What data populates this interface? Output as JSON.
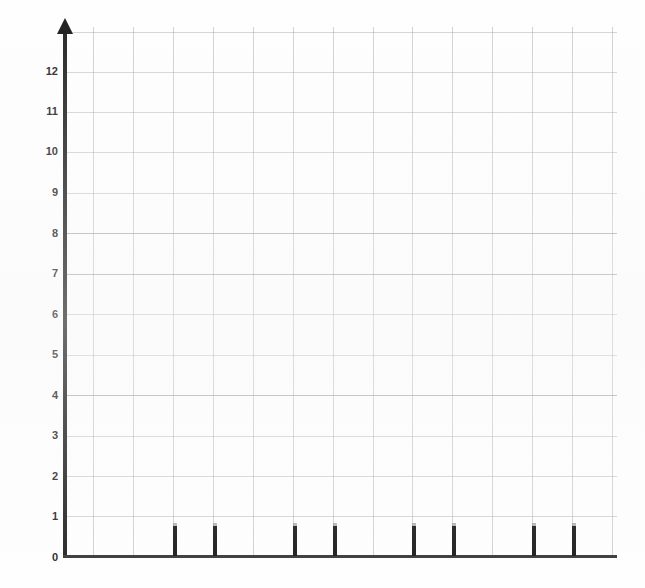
{
  "chart_data": {
    "type": "bar",
    "title": "",
    "subtitle": "",
    "xlabel": "",
    "ylabel": "",
    "categories": [
      "1",
      "2",
      "3",
      "4",
      "5",
      "6",
      "7",
      "8"
    ],
    "values": [
      0.75,
      0.75,
      0.75,
      0.75,
      0.75,
      0.75,
      0.75,
      0.75
    ],
    "series": [
      {
        "name": "",
        "values": [
          0.75,
          0.75,
          0.75,
          0.75,
          0.75,
          0.75,
          0.75,
          0.75
        ]
      }
    ],
    "ylim": [
      0,
      12.7
    ],
    "xlim": [
      0,
      13.8
    ],
    "ytick_labels": [
      "0",
      "1",
      "2",
      "3",
      "4",
      "5",
      "6",
      "7",
      "8",
      "9",
      "10",
      "11",
      "12"
    ],
    "ytick_values": [
      0,
      1,
      2,
      3,
      4,
      5,
      6,
      7,
      8,
      9,
      10,
      11,
      12
    ],
    "xtick_labels": [],
    "grid": true,
    "grid_x_count": 14,
    "grid_y_count": 13,
    "legend": null,
    "legend_position": "none",
    "annotations": [],
    "bar_slots": [
      2,
      3,
      5,
      6,
      8,
      9,
      11,
      12
    ],
    "colors": {
      "bar": "#1c1c1c",
      "axis": "#262626",
      "grid": "#9b9ea8",
      "background": "#fefefe",
      "tick_label": "#2a2a2a"
    }
  },
  "axes": {
    "y_axis_name": "vertical-value-axis",
    "x_axis_name": "horizontal-category-axis",
    "arrow_at_top": true
  }
}
